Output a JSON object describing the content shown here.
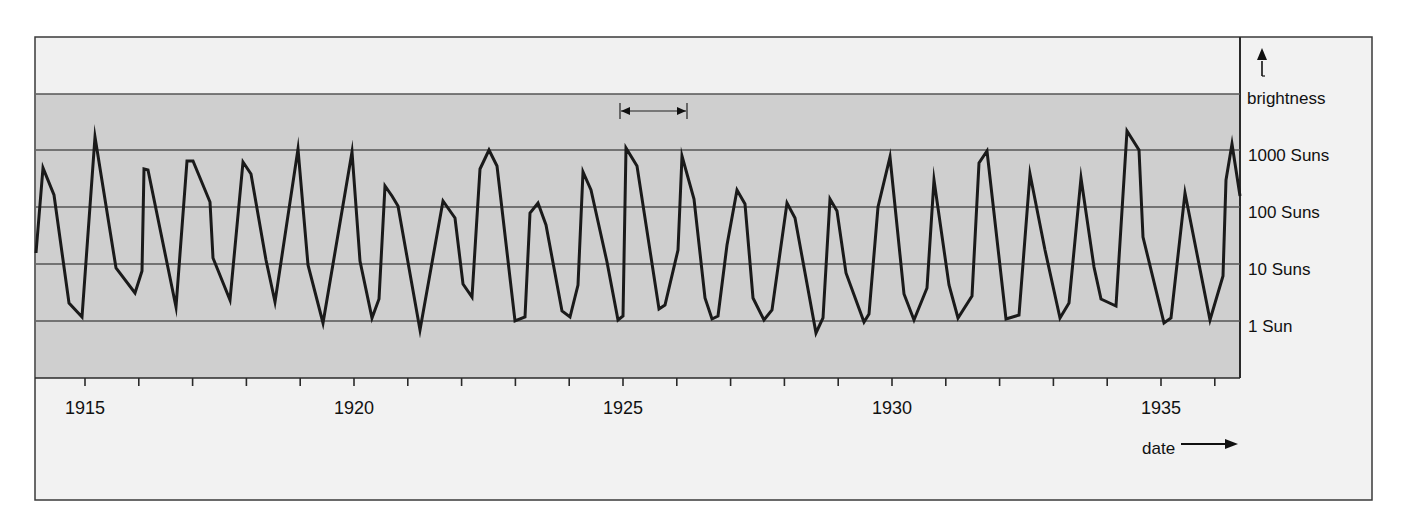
{
  "chart_data": {
    "type": "line",
    "title": "",
    "xlabel": "date",
    "ylabel": "brightness",
    "y_scale": "log",
    "y_ticks": [
      {
        "label": "1000 Suns",
        "value": 1000
      },
      {
        "label": "100 Suns",
        "value": 100
      },
      {
        "label": "10 Suns",
        "value": 10
      },
      {
        "label": "1 Sun",
        "value": 1
      }
    ],
    "x_ticks": [
      {
        "label": "1915",
        "value": 1915
      },
      {
        "label": "1920",
        "value": 1920
      },
      {
        "label": "1925",
        "value": 1925
      },
      {
        "label": "1930",
        "value": 1930
      },
      {
        "label": "1935",
        "value": 1935
      }
    ],
    "xlim": [
      1914.1,
      1936.2
    ],
    "ylim": [
      0.1,
      10000
    ],
    "grid": {
      "horizontal": true,
      "vertical": false
    },
    "legend": null,
    "annotations": [
      {
        "type": "double-arrow",
        "label": "",
        "from_year": 1924.9,
        "to_year": 1926.1,
        "meaning": "one pulsation period"
      }
    ],
    "series": [
      {
        "name": "brightness",
        "color": "#1a1a1a",
        "points_px": [
          [
            36,
            253
          ],
          [
            43,
            168
          ],
          [
            54,
            195
          ],
          [
            69,
            303
          ],
          [
            82,
            317
          ],
          [
            95,
            137
          ],
          [
            116,
            268
          ],
          [
            135,
            293
          ],
          [
            142,
            271
          ],
          [
            144,
            169
          ],
          [
            148,
            170
          ],
          [
            176,
            307
          ],
          [
            187,
            161
          ],
          [
            193,
            161
          ],
          [
            210,
            202
          ],
          [
            213,
            258
          ],
          [
            230,
            300
          ],
          [
            243,
            162
          ],
          [
            251,
            174
          ],
          [
            266,
            260
          ],
          [
            275,
            302
          ],
          [
            298,
            149
          ],
          [
            308,
            265
          ],
          [
            323,
            323
          ],
          [
            352,
            152
          ],
          [
            360,
            261
          ],
          [
            372,
            318
          ],
          [
            379,
            299
          ],
          [
            385,
            186
          ],
          [
            392,
            196
          ],
          [
            398,
            206
          ],
          [
            420,
            330
          ],
          [
            443,
            201
          ],
          [
            455,
            218
          ],
          [
            463,
            284
          ],
          [
            472,
            297
          ],
          [
            480,
            169
          ],
          [
            489,
            150
          ],
          [
            497,
            166
          ],
          [
            515,
            321
          ],
          [
            525,
            317
          ],
          [
            530,
            213
          ],
          [
            538,
            203
          ],
          [
            546,
            225
          ],
          [
            562,
            311
          ],
          [
            570,
            317
          ],
          [
            578,
            285
          ],
          [
            583,
            172
          ],
          [
            591,
            190
          ],
          [
            607,
            262
          ],
          [
            618,
            320
          ],
          [
            623,
            316
          ],
          [
            626,
            148
          ],
          [
            637,
            166
          ],
          [
            659,
            309
          ],
          [
            665,
            305
          ],
          [
            678,
            250
          ],
          [
            682,
            156
          ],
          [
            694,
            199
          ],
          [
            705,
            298
          ],
          [
            712,
            319
          ],
          [
            718,
            316
          ],
          [
            727,
            245
          ],
          [
            737,
            190
          ],
          [
            745,
            204
          ],
          [
            753,
            298
          ],
          [
            764,
            320
          ],
          [
            772,
            310
          ],
          [
            787,
            203
          ],
          [
            795,
            218
          ],
          [
            816,
            333
          ],
          [
            823,
            318
          ],
          [
            830,
            199
          ],
          [
            837,
            211
          ],
          [
            846,
            273
          ],
          [
            864,
            322
          ],
          [
            869,
            314
          ],
          [
            878,
            207
          ],
          [
            890,
            157
          ],
          [
            904,
            294
          ],
          [
            914,
            320
          ],
          [
            927,
            288
          ],
          [
            934,
            180
          ],
          [
            949,
            285
          ],
          [
            958,
            318
          ],
          [
            972,
            296
          ],
          [
            979,
            163
          ],
          [
            987,
            151
          ],
          [
            1006,
            319
          ],
          [
            1019,
            315
          ],
          [
            1030,
            174
          ],
          [
            1045,
            250
          ],
          [
            1060,
            318
          ],
          [
            1069,
            303
          ],
          [
            1081,
            178
          ],
          [
            1094,
            267
          ],
          [
            1101,
            299
          ],
          [
            1116,
            306
          ],
          [
            1127,
            131
          ],
          [
            1139,
            150
          ],
          [
            1143,
            237
          ],
          [
            1164,
            323
          ],
          [
            1171,
            318
          ],
          [
            1185,
            193
          ],
          [
            1210,
            320
          ],
          [
            1223,
            276
          ],
          [
            1226,
            180
          ],
          [
            1232,
            144
          ],
          [
            1240,
            196
          ]
        ]
      }
    ]
  },
  "axis": {
    "y_label": "brightness",
    "y_tick_labels": [
      "1000 Suns",
      "100 Suns",
      "10 Suns",
      "1 Sun"
    ],
    "x_label": "date",
    "x_tick_labels": [
      "1915",
      "1920",
      "1925",
      "1930",
      "1935"
    ]
  },
  "colors": {
    "frame": "#3a3a3a",
    "upper_band": "#f1f1f1",
    "plot_band": "#cfcfcf",
    "outer_bg": "#f2f2f2",
    "gridline": "#555555",
    "line": "#111111",
    "text": "#111111"
  }
}
